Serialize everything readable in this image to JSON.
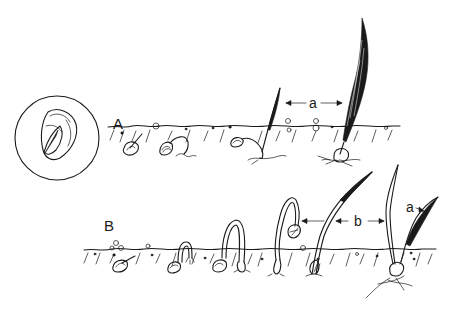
{
  "figure": {
    "rows": [
      {
        "id": "A",
        "label": "A",
        "dimension_label": "a"
      },
      {
        "id": "B",
        "label": "B",
        "dimension_label": "b",
        "leaf_label": "a"
      }
    ],
    "inset": {
      "label": "seed cross-section"
    },
    "colors": {
      "ink": "#1a1a1a",
      "background": "#ffffff"
    }
  }
}
